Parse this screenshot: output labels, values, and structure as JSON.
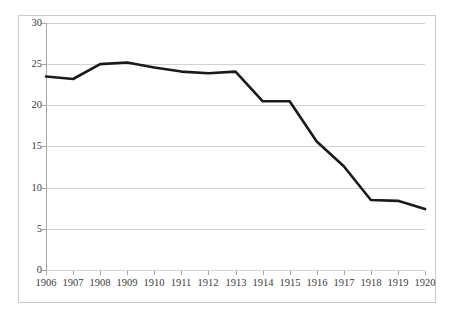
{
  "chart_data": {
    "type": "line",
    "title": "",
    "subtitle": "",
    "xlabel": "",
    "ylabel": "",
    "categories": [
      "1906",
      "1907",
      "1908",
      "1909",
      "1910",
      "1911",
      "1912",
      "1913",
      "1914",
      "1915",
      "1916",
      "1917",
      "1918",
      "1919",
      "1920"
    ],
    "x": [
      1906,
      1907,
      1908,
      1909,
      1910,
      1911,
      1912,
      1913,
      1914,
      1915,
      1916,
      1917,
      1918,
      1919,
      1920
    ],
    "values": [
      23.5,
      23.2,
      25.0,
      25.2,
      24.6,
      24.1,
      23.9,
      24.1,
      20.5,
      20.5,
      15.6,
      12.6,
      8.5,
      8.4,
      7.4
    ],
    "series": [
      {
        "name": "series-1",
        "values": [
          23.5,
          23.2,
          25.0,
          25.2,
          24.6,
          24.1,
          23.9,
          24.1,
          20.5,
          20.5,
          15.6,
          12.6,
          8.5,
          8.4,
          7.4
        ],
        "color": "#1a1a1a",
        "line_width": 2.6
      }
    ],
    "ylim": [
      0,
      30
    ],
    "ytick_values": [
      0,
      5,
      10,
      15,
      20,
      25,
      30
    ],
    "ytick_labels": [
      "0",
      "5",
      "10",
      "15",
      "20",
      "25",
      "30"
    ],
    "xtick_labels": [
      "1906",
      "1907",
      "1908",
      "1909",
      "1910",
      "1911",
      "1912",
      "1913",
      "1914",
      "1915",
      "1916",
      "1917",
      "1918",
      "1919",
      "1920"
    ],
    "grid": {
      "horizontal": true,
      "vertical": false,
      "color": "#d2d2d2"
    },
    "legend": {
      "visible": false,
      "position": "none",
      "entries": []
    },
    "annotations": [],
    "axis_color": "#a6a6a6",
    "border_color": "#c9c9c9",
    "background": "#ffffff",
    "tick_label_color": "#3a3a3a"
  }
}
